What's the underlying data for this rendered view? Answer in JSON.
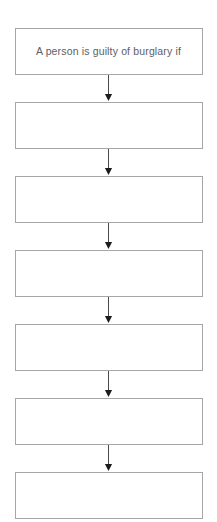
{
  "diagram": {
    "orientation": "vertical-top-down",
    "node_count": 7,
    "connector_count": 6,
    "colors": {
      "page_background": "#ffffff",
      "node_fill": "#ffffff",
      "node_border": "#a6a6a6",
      "node_text": "#5e5e5e",
      "connector_line": "#4a4a4a",
      "connector_arrowhead": "#1c1c1c"
    },
    "nodes": [
      {
        "id": "node-1",
        "label": "A person is guilty of burglary if"
      },
      {
        "id": "node-2",
        "label": ""
      },
      {
        "id": "node-3",
        "label": ""
      },
      {
        "id": "node-4",
        "label": ""
      },
      {
        "id": "node-5",
        "label": ""
      },
      {
        "id": "node-6",
        "label": ""
      },
      {
        "id": "node-7",
        "label": ""
      }
    ],
    "connectors": [
      {
        "id": "connector-1",
        "from": "node-1",
        "to": "node-2",
        "arrow": "down-arrow"
      },
      {
        "id": "connector-2",
        "from": "node-2",
        "to": "node-3",
        "arrow": "down-arrow"
      },
      {
        "id": "connector-3",
        "from": "node-3",
        "to": "node-4",
        "arrow": "down-arrow"
      },
      {
        "id": "connector-4",
        "from": "node-4",
        "to": "node-5",
        "arrow": "down-arrow"
      },
      {
        "id": "connector-5",
        "from": "node-5",
        "to": "node-6",
        "arrow": "down-arrow"
      },
      {
        "id": "connector-6",
        "from": "node-6",
        "to": "node-7",
        "arrow": "down-arrow"
      }
    ]
  }
}
